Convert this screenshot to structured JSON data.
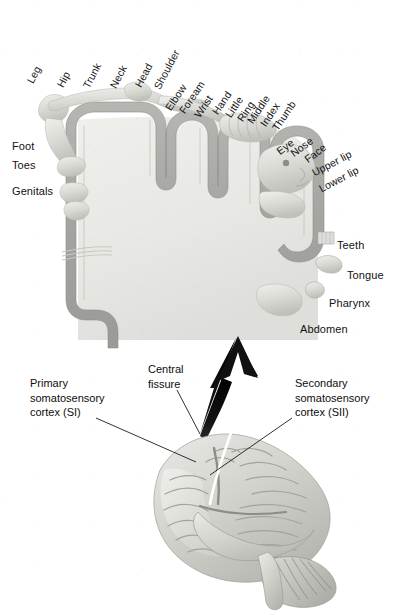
{
  "diagram": {
    "colors": {
      "cortex_ribbon": "#a9a9a6",
      "cortex_interior": "#e9e9e6",
      "body_light": "#d8d8d4",
      "brain_light": "#dcdcd8",
      "brain_mid": "#b9b9b4",
      "arrow": "#111111",
      "text": "#121212",
      "leader_line": "#1a1a1a",
      "fissure_highlight": "#ffffff",
      "background": "#ffffff"
    }
  },
  "homunculus": {
    "rotated_labels": [
      {
        "text": "Leg",
        "x": 30,
        "y": 76,
        "angle": -62
      },
      {
        "text": "Hip",
        "x": 60,
        "y": 80,
        "angle": -62
      },
      {
        "text": "Trunk",
        "x": 86,
        "y": 81,
        "angle": -62
      },
      {
        "text": "Neck",
        "x": 113,
        "y": 81,
        "angle": -62
      },
      {
        "text": "Head",
        "x": 138,
        "y": 80,
        "angle": -62
      },
      {
        "text": "Shoulder",
        "x": 157,
        "y": 82,
        "angle": -62
      },
      {
        "text": "Elbow",
        "x": 168,
        "y": 103,
        "angle": -56
      },
      {
        "text": "Foream",
        "x": 182,
        "y": 106,
        "angle": -56
      },
      {
        "text": "Wrist",
        "x": 197,
        "y": 110,
        "angle": -56
      },
      {
        "text": "Hand",
        "x": 215,
        "y": 107,
        "angle": -56
      },
      {
        "text": "Little",
        "x": 228,
        "y": 110,
        "angle": -56
      },
      {
        "text": "Ring",
        "x": 240,
        "y": 114,
        "angle": -56
      },
      {
        "text": "Middle",
        "x": 250,
        "y": 116,
        "angle": -56
      },
      {
        "text": "Index",
        "x": 263,
        "y": 119,
        "angle": -56
      },
      {
        "text": "Thumb",
        "x": 275,
        "y": 123,
        "angle": -56
      },
      {
        "text": "Eye",
        "x": 278,
        "y": 146,
        "angle": -37
      },
      {
        "text": "Nose",
        "x": 292,
        "y": 148,
        "angle": -37
      },
      {
        "text": "Face",
        "x": 306,
        "y": 154,
        "angle": -37
      },
      {
        "text": "Upper lip",
        "x": 313,
        "y": 167,
        "angle": -28
      },
      {
        "text": "Lower lip",
        "x": 320,
        "y": 183,
        "angle": -28
      }
    ],
    "left_labels": [
      {
        "text": "Foot",
        "x": 12,
        "y": 139
      },
      {
        "text": "Toes",
        "x": 12,
        "y": 158
      },
      {
        "text": "Genitals",
        "x": 12,
        "y": 184
      }
    ],
    "right_labels": [
      {
        "text": "Teeth",
        "x": 337,
        "y": 238
      },
      {
        "text": "Tongue",
        "x": 347,
        "y": 268
      },
      {
        "text": "Pharynx",
        "x": 329,
        "y": 296
      },
      {
        "text": "Abdomen",
        "x": 300,
        "y": 322
      }
    ]
  },
  "brain": {
    "callouts": [
      {
        "name": "primary-somatosensory-cortex",
        "lines": [
          "Primary",
          "somatosensory",
          "cortex (SI)"
        ],
        "x": 30,
        "y": 376,
        "leader": {
          "x1": 96,
          "y1": 418,
          "x2": 196,
          "y2": 462
        }
      },
      {
        "name": "central-fissure",
        "lines": [
          "Central",
          "fissure"
        ],
        "x": 148,
        "y": 362,
        "leader": {
          "x1": 177,
          "y1": 390,
          "x2": 200,
          "y2": 434
        }
      },
      {
        "name": "secondary-somatosensory-cortex",
        "lines": [
          "Secondary",
          "somatosensory",
          "cortex (SII)"
        ],
        "x": 295,
        "y": 376,
        "leader": {
          "x1": 292,
          "y1": 418,
          "x2": 210,
          "y2": 475
        }
      }
    ]
  }
}
